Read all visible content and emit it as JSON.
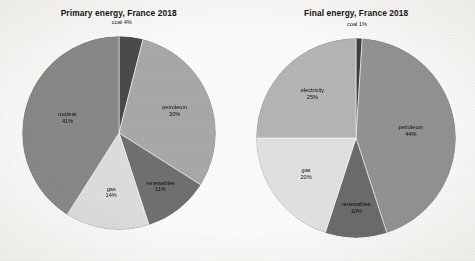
{
  "figure": {
    "background_color": "#fbfaf8",
    "panel_count": 2
  },
  "charts": [
    {
      "id": "primary-energy",
      "title": "Primary energy, France 2018",
      "slices": [
        {
          "label": "coal",
          "pct_text": "4%",
          "value": 4,
          "color": "#4a4a4a",
          "label_placement": "outside-top"
        },
        {
          "label": "petroleum",
          "pct_text": "30%",
          "value": 30,
          "color": "#a8a8a8",
          "label_placement": "inside"
        },
        {
          "label": "renewables",
          "pct_text": "11%",
          "value": 11,
          "color": "#707070",
          "label_placement": "inside"
        },
        {
          "label": "gas",
          "pct_text": "14%",
          "value": 14,
          "color": "#dcdcdc",
          "label_placement": "inside"
        },
        {
          "label": "nuclear",
          "pct_text": "41%",
          "value": 41,
          "color": "#888888",
          "label_placement": "inside"
        }
      ]
    },
    {
      "id": "final-energy",
      "title": "Final energy, France 2018",
      "slices": [
        {
          "label": "coal",
          "pct_text": "1%",
          "value": 1,
          "color": "#3f3f3f",
          "label_placement": "outside-top"
        },
        {
          "label": "petroleum",
          "pct_text": "44%",
          "value": 44,
          "color": "#929292",
          "label_placement": "inside"
        },
        {
          "label": "renewables",
          "pct_text": "10%",
          "value": 10,
          "color": "#6b6b6b",
          "label_placement": "inside"
        },
        {
          "label": "gas",
          "pct_text": "20%",
          "value": 20,
          "color": "#e0e0e0",
          "label_placement": "inside"
        },
        {
          "label": "electricity",
          "pct_text": "25%",
          "value": 25,
          "color": "#b4b4b4",
          "label_placement": "inside"
        }
      ]
    }
  ],
  "chart_data": [
    {
      "type": "pie",
      "title": "Primary energy, France 2018",
      "categories": [
        "coal",
        "petroleum",
        "renewables",
        "gas",
        "nuclear"
      ],
      "values": [
        4,
        30,
        11,
        14,
        41
      ],
      "value_labels": [
        "4%",
        "30%",
        "11%",
        "14%",
        "41%"
      ],
      "unit": "percent",
      "colors": [
        "#4a4a4a",
        "#a8a8a8",
        "#707070",
        "#dcdcdc",
        "#888888"
      ],
      "start_angle_deg": 0,
      "direction": "clockwise",
      "legend": "none",
      "labels_position": "inside-slices",
      "xlabel": "",
      "ylabel": ""
    },
    {
      "type": "pie",
      "title": "Final energy, France 2018",
      "categories": [
        "coal",
        "petroleum",
        "renewables",
        "gas",
        "electricity"
      ],
      "values": [
        1,
        44,
        10,
        20,
        25
      ],
      "value_labels": [
        "1%",
        "44%",
        "10%",
        "20%",
        "25%"
      ],
      "unit": "percent",
      "colors": [
        "#3f3f3f",
        "#929292",
        "#6b6b6b",
        "#e0e0e0",
        "#b4b4b4"
      ],
      "start_angle_deg": 0,
      "direction": "clockwise",
      "legend": "none",
      "labels_position": "inside-slices",
      "xlabel": "",
      "ylabel": ""
    }
  ]
}
